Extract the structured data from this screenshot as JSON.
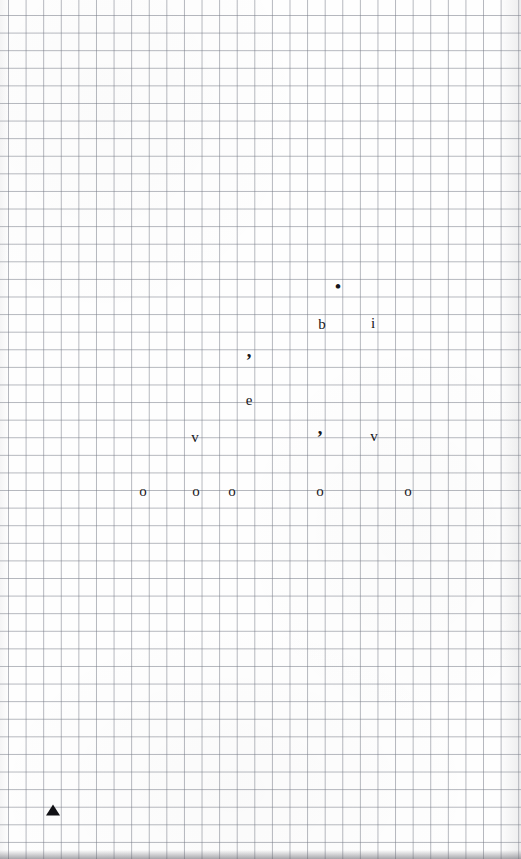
{
  "document": {
    "kind": "scanned-graph-paper",
    "width": 521,
    "height": 859,
    "paper_color": "#fdfdfd",
    "grid_line_color": "#787c88",
    "grid_cell_px": 17.6,
    "ink_color": "#16161a"
  },
  "marks": [
    {
      "id": "mark-dot",
      "text": "•",
      "kind": "dot",
      "x": 338,
      "y": 286
    },
    {
      "id": "mark-b",
      "text": "b",
      "kind": "letter",
      "x": 322,
      "y": 324
    },
    {
      "id": "mark-i",
      "text": "i",
      "kind": "letter",
      "x": 373,
      "y": 323
    },
    {
      "id": "mark-comma-1",
      "text": "’",
      "kind": "mark",
      "x": 249,
      "y": 360
    },
    {
      "id": "mark-e",
      "text": "e",
      "kind": "letter",
      "x": 249,
      "y": 400
    },
    {
      "id": "mark-v-left",
      "text": "v",
      "kind": "letter",
      "x": 195,
      "y": 437
    },
    {
      "id": "mark-comma-2",
      "text": "’",
      "kind": "mark",
      "x": 320,
      "y": 437
    },
    {
      "id": "mark-v-right",
      "text": "v",
      "kind": "letter",
      "x": 374,
      "y": 436
    },
    {
      "id": "mark-o-1",
      "text": "o",
      "kind": "letter",
      "x": 143,
      "y": 491
    },
    {
      "id": "mark-o-2",
      "text": "o",
      "kind": "letter",
      "x": 196,
      "y": 491
    },
    {
      "id": "mark-o-3",
      "text": "o",
      "kind": "letter",
      "x": 232,
      "y": 491
    },
    {
      "id": "mark-o-4",
      "text": "o",
      "kind": "letter",
      "x": 320,
      "y": 491
    },
    {
      "id": "mark-o-5",
      "text": "o",
      "kind": "letter",
      "x": 408,
      "y": 491
    }
  ],
  "shapes": [
    {
      "id": "triangle-marker",
      "name": "solid-triangle-marker",
      "x": 53,
      "y": 810
    }
  ]
}
